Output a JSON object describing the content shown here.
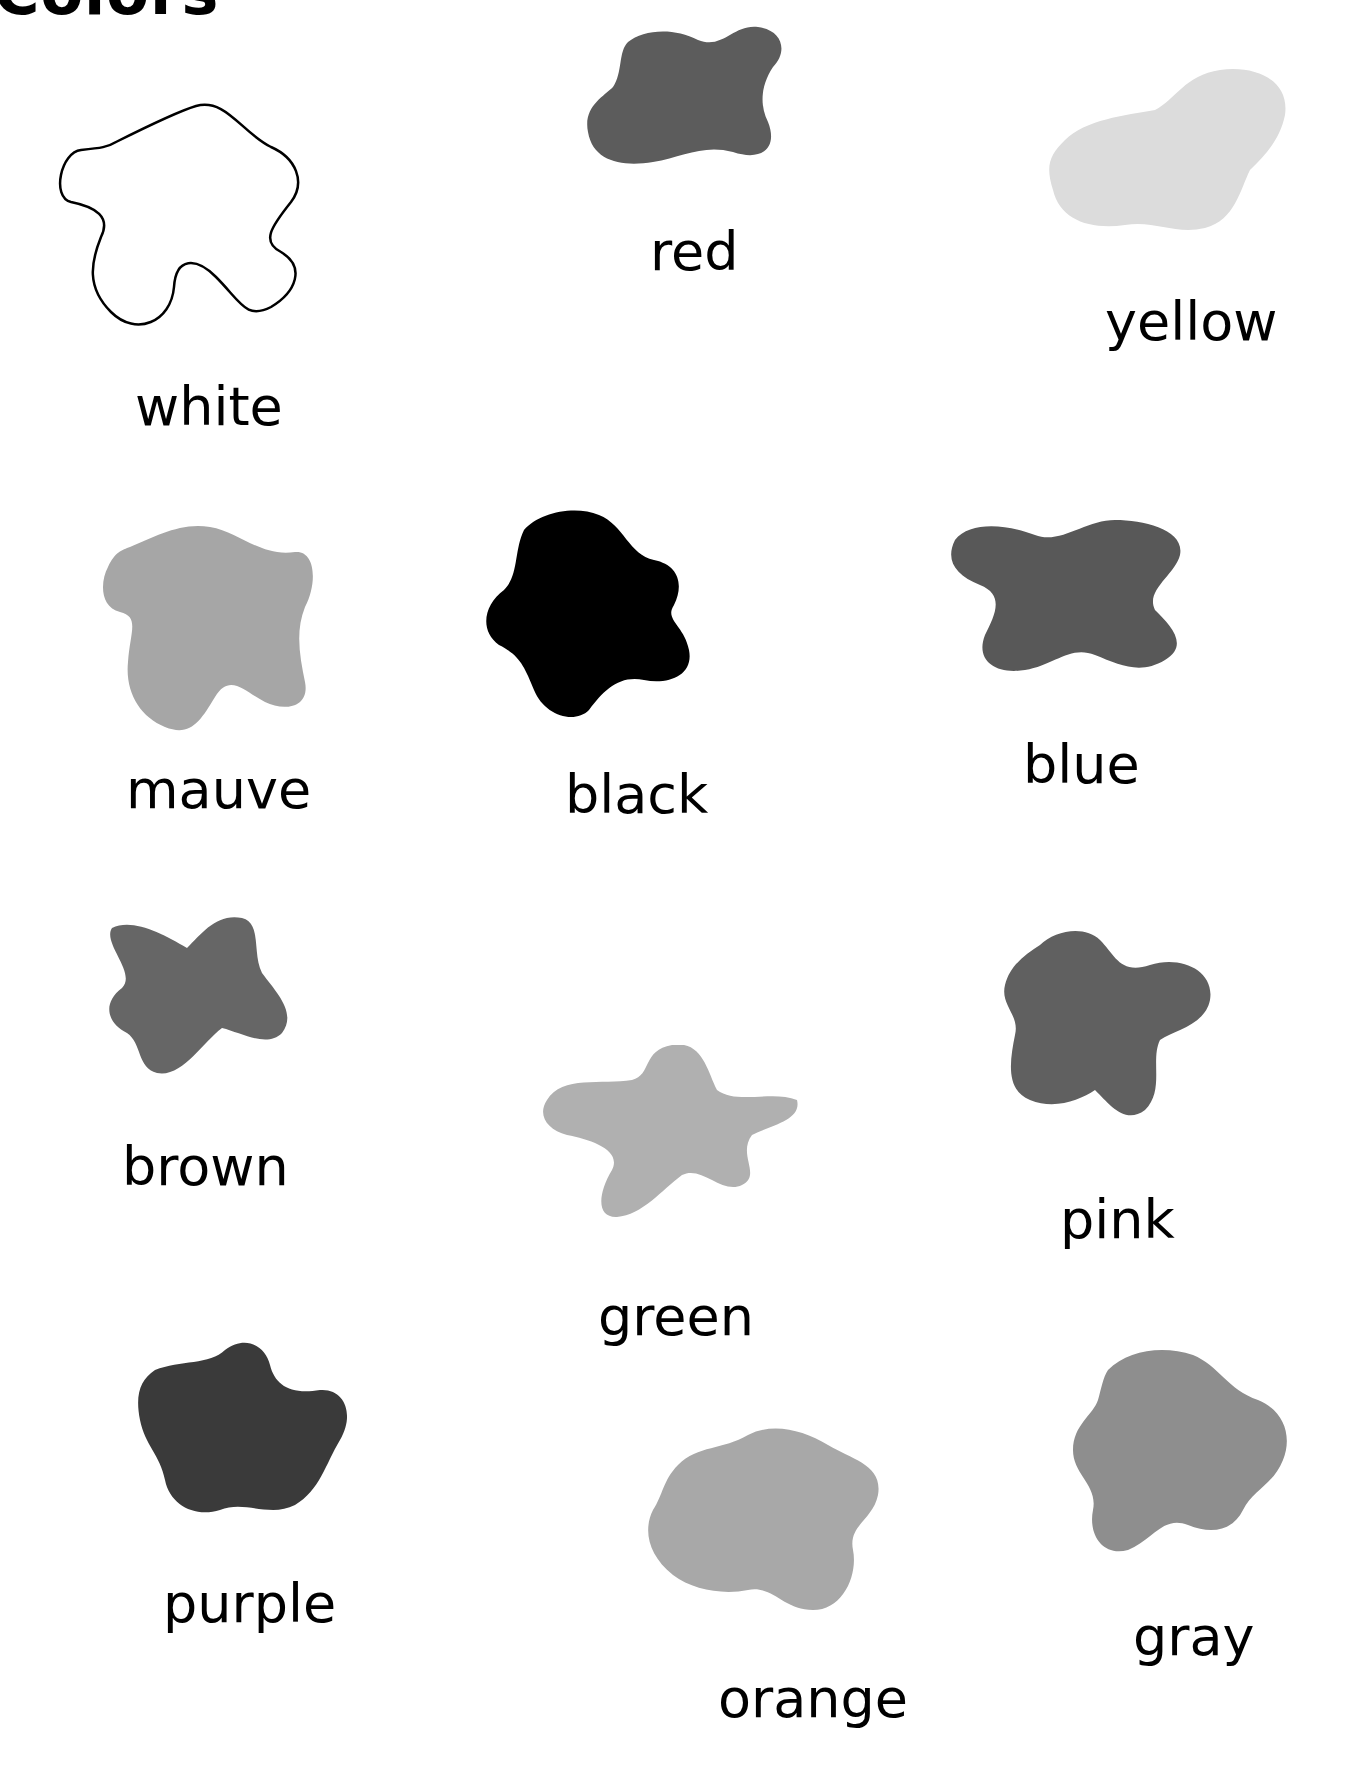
{
  "page": {
    "title": "Colors"
  },
  "swatches": [
    {
      "label": "white",
      "fill": "#ffffff",
      "outline": true
    },
    {
      "label": "red",
      "fill": "#5c5c5c"
    },
    {
      "label": "yellow",
      "fill": "#dcdcdc"
    },
    {
      "label": "mauve",
      "fill": "#a6a6a6"
    },
    {
      "label": "black",
      "fill": "#000000"
    },
    {
      "label": "blue",
      "fill": "#585858"
    },
    {
      "label": "brown",
      "fill": "#666666"
    },
    {
      "label": "green",
      "fill": "#b0b0b0"
    },
    {
      "label": "pink",
      "fill": "#606060"
    },
    {
      "label": "purple",
      "fill": "#3a3a3a"
    },
    {
      "label": "orange",
      "fill": "#a8a8a8"
    },
    {
      "label": "gray",
      "fill": "#8e8e8e"
    }
  ]
}
